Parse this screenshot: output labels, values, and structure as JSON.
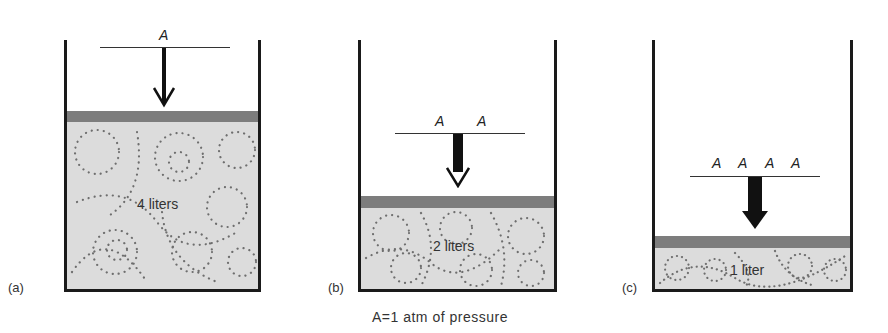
{
  "figure": {
    "panels": [
      {
        "id": "a",
        "label": "(a)",
        "weights": [
          "A"
        ],
        "volume_label": "4 liters",
        "weight_count": 1
      },
      {
        "id": "b",
        "label": "(b)",
        "weights": [
          "A",
          "A"
        ],
        "volume_label": "2 liters",
        "weight_count": 2
      },
      {
        "id": "c",
        "label": "(c)",
        "weights": [
          "A",
          "A",
          "A",
          "A"
        ],
        "volume_label": "1 liter",
        "weight_count": 4
      }
    ],
    "caption": "A=1 atm of pressure",
    "colors": {
      "wall": "#1a1a1a",
      "piston": "#7d7d7d",
      "gas": "#dcdcdc",
      "molecule": "#6e6e6e",
      "arrow": "#111111"
    }
  }
}
